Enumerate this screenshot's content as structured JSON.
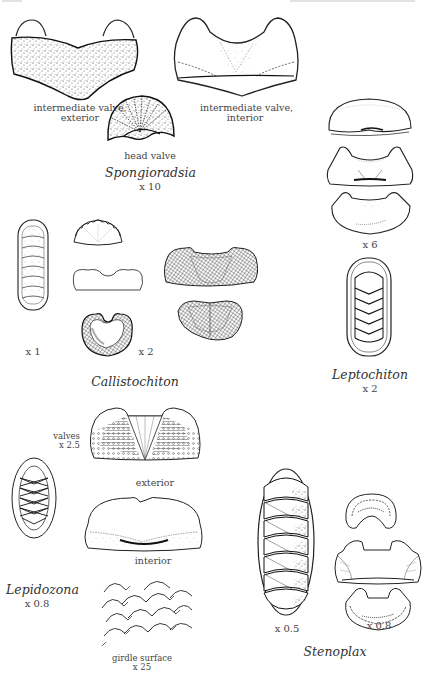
{
  "page": {
    "background": "#ffffff",
    "ink_color": "#2a2a2a",
    "header_cropped": true
  },
  "figures": {
    "spongioradsia": {
      "genus": "Spongioradsia",
      "scale": "x 10",
      "labels": {
        "intermediate_exterior_line1": "intermediate valve,",
        "intermediate_exterior_line2": "exterior",
        "intermediate_interior_line1": "intermediate valve,",
        "intermediate_interior_line2": "interior",
        "head_valve": "head valve"
      }
    },
    "leptochiton": {
      "genus": "Leptochiton",
      "valves_scale": "x 6",
      "whole_scale": "x 2"
    },
    "callistochiton": {
      "genus": "Callistochiton",
      "whole_scale": "x 1",
      "valves_scale": "x 2"
    },
    "lepidozona": {
      "genus": "Lepidozona",
      "whole_scale": "x 0.8",
      "labels": {
        "valves_line1": "valves",
        "valves_line2": "x 2.5",
        "exterior": "exterior",
        "interior": "interior",
        "girdle_line1": "girdle surface",
        "girdle_line2": "x 25"
      }
    },
    "stenoplax": {
      "genus": "Stenoplax",
      "whole_scale": "x 0.5",
      "valves_scale": "x 0.8"
    }
  }
}
